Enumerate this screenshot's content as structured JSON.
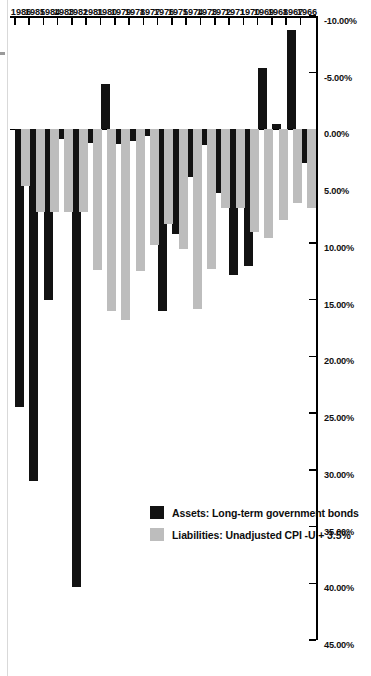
{
  "chart_data": {
    "type": "bar",
    "orientation": "horizontal-rotated",
    "title": "",
    "xlabel": "",
    "ylabel": "",
    "categories": [
      1966,
      1967,
      1968,
      1969,
      1970,
      1971,
      1972,
      1973,
      1974,
      1975,
      1976,
      1977,
      1978,
      1979,
      1980,
      1981,
      1982,
      1983,
      1984,
      1985,
      1986
    ],
    "category_labels": [
      "1966",
      "1967",
      "1968",
      "1969",
      "1970",
      "1971",
      "1972",
      "1973",
      "1974",
      "1975",
      "1976",
      "1977",
      "1978",
      "1979",
      "1980",
      "1981",
      "1982",
      "1983",
      "1984",
      "1985",
      "1986"
    ],
    "value_ticks": [
      45,
      40,
      35,
      30,
      25,
      20,
      15,
      10,
      5,
      0,
      -5,
      -10
    ],
    "value_tick_labels": [
      "45.00%",
      "40.00%",
      "35.00%",
      "30.00%",
      "25.00%",
      "20.00%",
      "15.00%",
      "10.00%",
      "5.00%",
      "0.00%",
      "-5.00%",
      "-10.00%"
    ],
    "vlim": [
      -10,
      45
    ],
    "grid": false,
    "legend_position": "left-center",
    "series": [
      {
        "name": "Assets: Long-term government bonds",
        "color": "#121212",
        "values": [
          3.0,
          -8.8,
          -0.5,
          -5.4,
          12.0,
          12.8,
          5.6,
          1.4,
          4.2,
          9.2,
          16.0,
          0.6,
          1.0,
          1.3,
          -4.0,
          1.2,
          40.3,
          0.8,
          15.0,
          31.0,
          24.5
        ]
      },
      {
        "name": "Liabilities: Unadjusted CPI -U + 3.5%",
        "color": "#bdbdbd",
        "values": [
          6.9,
          6.5,
          8.0,
          9.6,
          9.0,
          6.9,
          6.9,
          12.3,
          15.8,
          10.5,
          8.3,
          10.2,
          12.5,
          16.8,
          16.0,
          12.4,
          7.3,
          7.3,
          7.3,
          7.3,
          5.0
        ]
      }
    ]
  },
  "legend": {
    "items": [
      {
        "label": "Assets: Long-term government bonds",
        "series": "assets"
      },
      {
        "label": "Liabilities: Unadjusted CPI -U + 3.5%",
        "series": "liab"
      }
    ]
  }
}
